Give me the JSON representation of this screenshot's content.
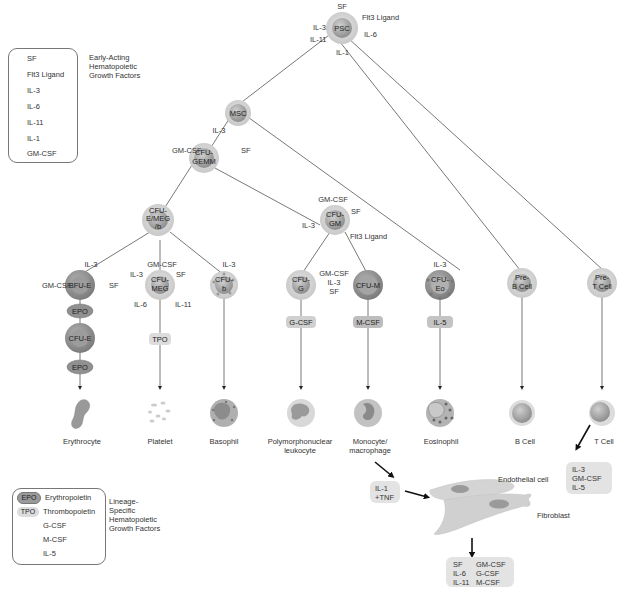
{
  "legends": {
    "early_acting": {
      "title_lines": [
        "Early-Acting",
        "Hematopoietic",
        "Growth Factors"
      ],
      "items": [
        "SF",
        "Flt3 Ligand",
        "IL-3",
        "IL-6",
        "IL-11",
        "IL-1",
        "GM-CSF"
      ]
    },
    "lineage_specific": {
      "title_lines": [
        "Lineage-",
        "Specific",
        "Hematopoietic",
        "Growth Factors"
      ],
      "items": [
        {
          "abbr": "EPO",
          "label": "Erythropoietin",
          "style": "dark"
        },
        {
          "abbr": "TPO",
          "label": "Thrombopoietin",
          "style": "light"
        },
        {
          "abbr": "",
          "label": "G-CSF",
          "style": "none"
        },
        {
          "abbr": "",
          "label": "M-CSF",
          "style": "none"
        },
        {
          "abbr": "",
          "label": "IL-5",
          "style": "none"
        }
      ]
    }
  },
  "nodes": {
    "psc": {
      "label": "PSC",
      "factors": {
        "top": "SF",
        "right_top": "Flt3 Ligand",
        "left_top": "IL-3",
        "left_bottom": "IL-11",
        "right_bottom": "IL-6",
        "bottom": "IL-1"
      }
    },
    "msc": {
      "label": "MSC"
    },
    "cfu_gemm": {
      "label_lines": [
        "CFU-",
        "GEMM"
      ],
      "factors": {
        "top": "IL-3",
        "left": "GM-CSF",
        "right": "SF"
      }
    },
    "cfu_e_meg": {
      "label_lines": [
        "CFU-",
        "E/MEG",
        "/b"
      ]
    },
    "cfu_gm": {
      "label_lines": [
        "CFU-",
        "GM"
      ],
      "factors": {
        "top": "GM-CSF",
        "right": "SF",
        "left": "IL-3",
        "right_bottom": "Flt3 Ligand"
      }
    },
    "bfu_e": {
      "label": "BFU-E",
      "factors": {
        "top": "IL-3",
        "left": "GM-CSF",
        "right": "SF"
      }
    },
    "cfu_e": {
      "label": "CFU-E"
    },
    "cfu_meg": {
      "label_lines": [
        "CFU-",
        "MEG"
      ],
      "factors": {
        "top": "GM-CSF",
        "left_top": "IL-3",
        "right_top": "SF",
        "left_bottom": "IL-6",
        "right_bottom": "IL-11"
      }
    },
    "cfu_b": {
      "label_lines": [
        "CFU-",
        "b"
      ],
      "factors": {
        "top": "IL-3"
      }
    },
    "cfu_g": {
      "label_lines": [
        "CFU-",
        "G"
      ]
    },
    "cfu_m": {
      "label": "CFU-M",
      "factors": {
        "left_lines": [
          "GM-CSF",
          "IL-3",
          "SF"
        ]
      }
    },
    "cfu_eo": {
      "label_lines": [
        "CFU-",
        "Eo"
      ],
      "factors": {
        "top": "IL-3"
      }
    },
    "pre_b": {
      "label_lines": [
        "Pre-",
        "B Cell"
      ]
    },
    "pre_t": {
      "label_lines": [
        "Pre-",
        "T Cell"
      ]
    }
  },
  "lineage_factors": {
    "epo1": "EPO",
    "epo2": "EPO",
    "tpo": "TPO",
    "gcsf": "G-CSF",
    "mcsf": "M-CSF",
    "il5": "IL-5"
  },
  "mature_cells": [
    {
      "id": "erythrocyte",
      "label_lines": [
        "Erythrocyte"
      ]
    },
    {
      "id": "platelet",
      "label_lines": [
        "Platelet"
      ]
    },
    {
      "id": "basophil",
      "label_lines": [
        "Basophil"
      ]
    },
    {
      "id": "pmn",
      "label_lines": [
        "Polymorphonuclear",
        "leukocyte"
      ]
    },
    {
      "id": "monocyte",
      "label_lines": [
        "Monocyte/",
        "macrophage"
      ]
    },
    {
      "id": "eosinophil",
      "label_lines": [
        "Eosinophil"
      ]
    },
    {
      "id": "b_cell",
      "label_lines": [
        "B Cell"
      ]
    },
    {
      "id": "t_cell",
      "label_lines": [
        "T Cell"
      ]
    }
  ],
  "secreted": {
    "t_cell_box": [
      "IL-3",
      "GM-CSF",
      "IL-5"
    ],
    "monocyte_box": [
      "IL-1",
      "+TNF"
    ],
    "stromal_labels": {
      "endothelial": "Endothelial cell",
      "fibroblast": "Fibroblast"
    },
    "stromal_box": [
      [
        "SF",
        "GM-CSF"
      ],
      [
        "IL-6",
        "G-CSF"
      ],
      [
        "IL-11",
        "M-CSF"
      ]
    ]
  },
  "colors": {
    "line": "#555555",
    "cell_outer": "#d9d9d9",
    "cell_inner": "#a8a8a8",
    "epo_fill": "#9a9a9a",
    "factor_box": "#e0e0e0"
  }
}
